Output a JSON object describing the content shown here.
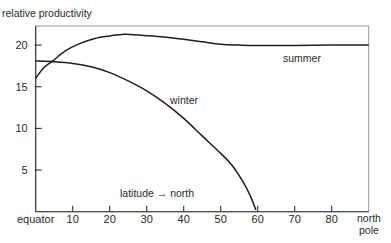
{
  "chart_data": {
    "type": "line",
    "title": "",
    "ylabel": "relative productivity",
    "xlabel": "latitude → north",
    "x_start_label": "equator",
    "x_end_label": [
      "north",
      "pole"
    ],
    "xlim": [
      0,
      90
    ],
    "ylim": [
      0,
      22.5
    ],
    "xticks": [
      10,
      20,
      30,
      40,
      50,
      60,
      70,
      80
    ],
    "yticks": [
      5,
      10,
      15,
      20
    ],
    "grid": false,
    "legend": "inline labels",
    "series": [
      {
        "name": "summer",
        "label_pos": {
          "x": 283,
          "y": 62
        },
        "points": [
          [
            0,
            16
          ],
          [
            2,
            17.2
          ],
          [
            4.6,
            18.1
          ],
          [
            8,
            19.3
          ],
          [
            12,
            20.2
          ],
          [
            16,
            20.8
          ],
          [
            20,
            21.1
          ],
          [
            24,
            21.3
          ],
          [
            28,
            21.2
          ],
          [
            34,
            21.0
          ],
          [
            40,
            20.7
          ],
          [
            45,
            20.4
          ],
          [
            50,
            20.1
          ],
          [
            55,
            20.0
          ],
          [
            60,
            19.95
          ],
          [
            70,
            19.95
          ],
          [
            80,
            20.0
          ],
          [
            90,
            20.0
          ]
        ]
      },
      {
        "name": "winter",
        "label_pos": {
          "x": 170,
          "y": 104
        },
        "points": [
          [
            0,
            18.1
          ],
          [
            5,
            18.0
          ],
          [
            10,
            17.8
          ],
          [
            15,
            17.4
          ],
          [
            20,
            16.7
          ],
          [
            25,
            15.7
          ],
          [
            30,
            14.5
          ],
          [
            35,
            13.0
          ],
          [
            40,
            11.2
          ],
          [
            45,
            9.1
          ],
          [
            50,
            7.0
          ],
          [
            53,
            5.6
          ],
          [
            56,
            3.6
          ],
          [
            58,
            1.9
          ],
          [
            59.5,
            0.2
          ]
        ]
      }
    ]
  }
}
